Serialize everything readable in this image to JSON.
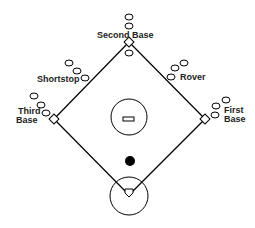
{
  "diagram": {
    "type": "baseball-field-positions",
    "colors": {
      "line": "#000000",
      "background": "#ffffff",
      "text": "#222222"
    },
    "labels": {
      "second_base": "Second Base",
      "shortstop": "Shortstop",
      "rover": "Rover",
      "third_base_line1": "Third",
      "third_base_line2": "Base",
      "first_base_line1": "First",
      "first_base_line2": "Base"
    },
    "bases": {
      "second": [
        129,
        42
      ],
      "third": [
        54,
        119
      ],
      "first": [
        205,
        119
      ],
      "home": [
        129,
        195
      ]
    },
    "players": {
      "second_base_group": [
        [
          129,
          17
        ],
        [
          129,
          26
        ],
        [
          129,
          53
        ]
      ],
      "shortstop_group": [
        [
          69,
          63
        ],
        [
          77,
          71
        ],
        [
          85,
          78
        ]
      ],
      "rover_group": [
        [
          184,
          63
        ],
        [
          175,
          68
        ],
        [
          171,
          77
        ]
      ],
      "third_base_group": [
        [
          34,
          96
        ],
        [
          41,
          105
        ],
        [
          46,
          113
        ]
      ],
      "first_base_group": [
        [
          226,
          100
        ],
        [
          216,
          106
        ],
        [
          215,
          115
        ]
      ]
    },
    "pitcher_circle": {
      "cx": 129,
      "cy": 117,
      "r": 18
    },
    "ball": {
      "cx": 130,
      "cy": 161,
      "r": 5
    },
    "home_circle": {
      "cx": 129,
      "cy": 196,
      "r": 19
    }
  }
}
